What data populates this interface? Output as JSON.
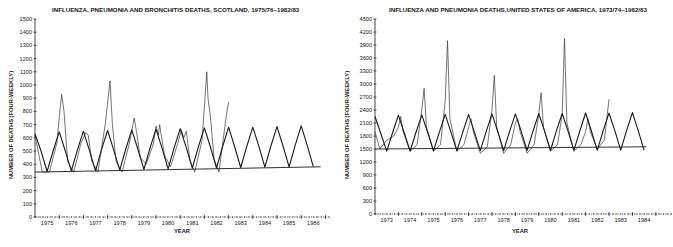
{
  "chart_data": [
    {
      "type": "line",
      "title": "INFLUENZA, PNEUMONIA AND BRONCHITIS DEATHS, SCOTLAND, 1975/76–1982/83",
      "xlabel": "YEAR",
      "ylabel": "NUMBER OF DEATHS (FOUR-WEEKLY)",
      "ylim": [
        0,
        1500
      ],
      "yticks": [
        0,
        100,
        200,
        300,
        400,
        500,
        600,
        700,
        800,
        900,
        1000,
        1100,
        1200,
        1300,
        1400,
        1500
      ],
      "xtick_labels": [
        "1975",
        "1976",
        "1977",
        "1978",
        "1979",
        "1980",
        "1981",
        "1982",
        "1983",
        "1984",
        "1985",
        "1986"
      ],
      "grid": false,
      "legend": null,
      "series": [
        {
          "name": "Observed deaths",
          "x": [
            1975.0,
            1975.3,
            1975.6,
            1975.9,
            1976.1,
            1976.2,
            1976.35,
            1976.6,
            1976.9,
            1977.1,
            1977.2,
            1977.35,
            1977.6,
            1977.9,
            1978.1,
            1978.2,
            1978.35,
            1978.6,
            1978.9,
            1979.1,
            1979.2,
            1979.35,
            1979.6,
            1979.9,
            1980.0,
            1980.1,
            1980.15,
            1980.2,
            1980.35,
            1980.6,
            1980.9,
            1981.05,
            1981.15,
            1981.25,
            1981.4,
            1981.6,
            1981.9,
            1982.1,
            1982.15,
            1982.25,
            1982.4,
            1982.6,
            1982.9,
            1983.0
          ],
          "values": [
            620,
            340,
            340,
            560,
            930,
            800,
            420,
            340,
            560,
            640,
            620,
            420,
            340,
            700,
            1030,
            700,
            420,
            340,
            560,
            750,
            640,
            450,
            400,
            560,
            690,
            620,
            700,
            640,
            470,
            380,
            560,
            660,
            600,
            650,
            430,
            340,
            580,
            1100,
            900,
            760,
            440,
            340,
            760,
            870
          ]
        },
        {
          "name": "Fitted seasonal curve",
          "x": [
            1975.0,
            1975.25,
            1975.5,
            1975.75,
            1976.0,
            1976.25,
            1976.5,
            1976.75,
            1977.0,
            1977.25,
            1977.5,
            1977.75,
            1978.0,
            1978.25,
            1978.5,
            1978.75,
            1979.0,
            1979.25,
            1979.5,
            1979.75,
            1980.0,
            1980.25,
            1980.5,
            1980.75,
            1981.0,
            1981.25,
            1981.5,
            1981.75,
            1982.0,
            1982.25,
            1982.5,
            1982.75,
            1983.0,
            1983.25,
            1983.5,
            1983.75,
            1984.0,
            1984.25,
            1984.5,
            1984.75,
            1985.0,
            1985.25,
            1985.5,
            1985.75,
            1986.0,
            1986.25,
            1986.5
          ],
          "values": [
            630,
            500,
            345,
            500,
            645,
            500,
            350,
            505,
            650,
            505,
            350,
            510,
            655,
            510,
            355,
            515,
            660,
            515,
            360,
            520,
            665,
            520,
            365,
            525,
            670,
            525,
            370,
            530,
            675,
            530,
            370,
            530,
            680,
            530,
            375,
            535,
            680,
            535,
            378,
            538,
            685,
            538,
            380,
            540,
            690,
            540,
            382
          ]
        },
        {
          "name": "Baseline (trend)",
          "x": [
            1975.0,
            1986.8
          ],
          "values": [
            340,
            380
          ]
        }
      ]
    },
    {
      "type": "line",
      "title": "INFLUENZA AND PNEUMONIA DEATHS,UNITED STATES OF AMERICA, 1973/74–1982/83",
      "xlabel": "YEAR",
      "ylabel": "NUMBER OF DEATHS (FOUR-WEEKLY)",
      "ylim": [
        0,
        4500
      ],
      "yticks": [
        0,
        300,
        600,
        900,
        1200,
        1500,
        1800,
        2100,
        2400,
        2700,
        3000,
        3300,
        3600,
        3900,
        4200,
        4500
      ],
      "xtick_labels": [
        "1973",
        "1974",
        "1975",
        "1976",
        "1977",
        "1978",
        "1979",
        "1980",
        "1981",
        "1982",
        "1983",
        "1984"
      ],
      "grid": false,
      "legend": null,
      "series": [
        {
          "name": "Observed deaths",
          "x": [
            1973.0,
            1973.2,
            1973.5,
            1973.8,
            1974.0,
            1974.1,
            1974.2,
            1974.5,
            1974.8,
            1975.0,
            1975.1,
            1975.2,
            1975.5,
            1975.8,
            1976.0,
            1976.1,
            1976.2,
            1976.5,
            1976.8,
            1977.0,
            1977.1,
            1977.2,
            1977.5,
            1977.8,
            1978.0,
            1978.1,
            1978.2,
            1978.5,
            1978.8,
            1979.0,
            1979.1,
            1979.2,
            1979.5,
            1979.8,
            1980.0,
            1980.1,
            1980.2,
            1980.5,
            1980.8,
            1981.0,
            1981.1,
            1981.2,
            1981.5,
            1981.8,
            1982.0,
            1982.1,
            1982.2,
            1982.5,
            1982.8,
            1983.0
          ],
          "values": [
            1900,
            1500,
            1700,
            1800,
            2000,
            2250,
            1900,
            1450,
            1600,
            2400,
            2900,
            2000,
            1450,
            1600,
            2600,
            4000,
            2200,
            1450,
            1600,
            2000,
            2200,
            1900,
            1400,
            1550,
            2400,
            3200,
            2000,
            1400,
            1600,
            2100,
            2200,
            1900,
            1400,
            1600,
            2300,
            2800,
            2000,
            1450,
            1600,
            2300,
            4050,
            2100,
            1450,
            1600,
            1900,
            2200,
            1900,
            1500,
            1700,
            2650
          ]
        },
        {
          "name": "Fitted seasonal curve",
          "x": [
            1973.0,
            1973.25,
            1973.5,
            1973.75,
            1974.0,
            1974.25,
            1974.5,
            1974.75,
            1975.0,
            1975.25,
            1975.5,
            1975.75,
            1976.0,
            1976.25,
            1976.5,
            1976.75,
            1977.0,
            1977.25,
            1977.5,
            1977.75,
            1978.0,
            1978.25,
            1978.5,
            1978.75,
            1979.0,
            1979.25,
            1979.5,
            1979.75,
            1980.0,
            1980.25,
            1980.5,
            1980.75,
            1981.0,
            1981.25,
            1981.5,
            1981.75,
            1982.0,
            1982.25,
            1982.5,
            1982.75,
            1983.0,
            1983.25,
            1983.5,
            1983.75,
            1984.0,
            1984.25,
            1984.5
          ],
          "values": [
            2250,
            1850,
            1450,
            1870,
            2280,
            1870,
            1450,
            1880,
            2290,
            1880,
            1455,
            1885,
            2300,
            1885,
            1455,
            1890,
            2300,
            1890,
            1460,
            1895,
            2310,
            1895,
            1460,
            1900,
            2310,
            1900,
            1465,
            1905,
            2320,
            1905,
            1465,
            1910,
            2320,
            1910,
            1470,
            1915,
            2330,
            1915,
            1470,
            1920,
            2330,
            1920,
            1475,
            1920,
            2340,
            1920,
            1475
          ]
        },
        {
          "name": "Baseline (trend)",
          "x": [
            1973.0,
            1984.6
          ],
          "values": [
            1500,
            1550
          ]
        }
      ]
    }
  ],
  "charts": {
    "left": {
      "title": "INFLUENZA, PNEUMONIA AND BRONCHITIS DEATHS, SCOTLAND, 1975/76–1982/83",
      "ylabel": "NUMBER OF DEATHS (FOUR-WEEKLY)",
      "xlabel": "YEAR"
    },
    "right": {
      "title": "INFLUENZA AND PNEUMONIA DEATHS,UNITED STATES OF AMERICA, 1973/74–1982/83",
      "ylabel": "NUMBER OF DEATHS (FOUR-WEEKLY)",
      "xlabel": "YEAR"
    }
  },
  "colors": {
    "line": "#1a1a1a",
    "observed": "#3a3a3a",
    "background": "#ffffff"
  }
}
